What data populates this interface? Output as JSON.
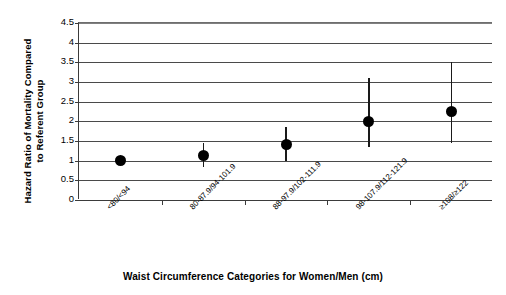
{
  "chart_data": {
    "type": "scatter",
    "title": "",
    "xlabel": "Waist Circumference Categories for Women/Men (cm)",
    "ylabel": "Hazard Ratio of Mortality Compared\nto Referent Group",
    "categories": [
      "<80/<94",
      "80-87.9/94-101.9",
      "88-97.9/102-111.9",
      "98-107.9/112-121.9",
      "≥108/≥122"
    ],
    "values": [
      1.0,
      1.13,
      1.4,
      2.0,
      2.25
    ],
    "error_low": [
      1.0,
      0.85,
      1.0,
      1.35,
      1.45
    ],
    "error_high": [
      1.0,
      1.45,
      1.85,
      3.1,
      3.5
    ],
    "ylim": [
      0,
      4.5
    ],
    "yticks": [
      0,
      0.5,
      1,
      1.5,
      2,
      2.5,
      3,
      3.5,
      4,
      4.5
    ],
    "ytick_labels": [
      "0",
      "0.5",
      "1",
      "1.5",
      "2",
      "2.5",
      "3",
      "3.5",
      "4",
      "4.5"
    ],
    "grid": true,
    "legend": "none",
    "marker_color": "#000000",
    "gridline_color": "#4a4a4a",
    "axis_color": "#3b3b3b"
  }
}
